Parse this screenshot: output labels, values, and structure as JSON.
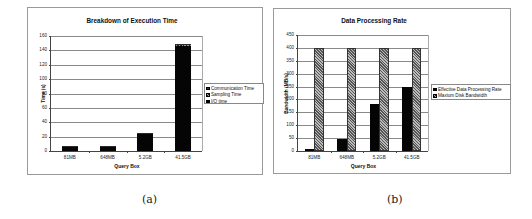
{
  "chart_data": [
    {
      "id": "a",
      "type": "bar",
      "stacked": true,
      "title": "Breakdown of Execution Time",
      "xlabel": "Query Box",
      "ylabel": "Time (s)",
      "ylim": [
        0,
        160
      ],
      "yticks": [
        0,
        20,
        40,
        60,
        80,
        100,
        120,
        140,
        160
      ],
      "grid": true,
      "legend_position": "right",
      "categories": [
        "81MB",
        "648MB",
        "5.2GB",
        "41.5GB"
      ],
      "series": [
        {
          "name": "I/O time",
          "values": [
            5,
            5,
            23,
            146
          ],
          "pattern": "solid-black"
        },
        {
          "name": "Sampling Time",
          "values": [
            1,
            1,
            1.5,
            2
          ],
          "pattern": "hatched"
        },
        {
          "name": "Communication Time",
          "values": [
            0.5,
            0.5,
            0.5,
            1
          ],
          "pattern": "dark-gray"
        }
      ],
      "legend_order": [
        "Communication Time",
        "Sampling Time",
        "I/O time"
      ],
      "caption": "(a)"
    },
    {
      "id": "b",
      "type": "bar",
      "stacked": false,
      "title": "Data Processing Rate",
      "xlabel": "Query Box",
      "ylabel": "Bandwidth (MB/s)",
      "ylim": [
        0,
        450
      ],
      "yticks": [
        0,
        50,
        100,
        150,
        200,
        250,
        300,
        350,
        400,
        450
      ],
      "grid": true,
      "legend_position": "right",
      "categories": [
        "81MB",
        "648MB",
        "5.2GB",
        "41.5GB"
      ],
      "series": [
        {
          "name": "Effective Data Processing Rate",
          "values": [
            7,
            48,
            183,
            250
          ],
          "pattern": "solid-black"
        },
        {
          "name": "Maxium Disk Bandwidth",
          "values": [
            400,
            400,
            400,
            400
          ],
          "pattern": "hatched"
        }
      ],
      "caption": "(b)"
    }
  ],
  "captions": {
    "a": "(a)",
    "b": "(b)"
  }
}
